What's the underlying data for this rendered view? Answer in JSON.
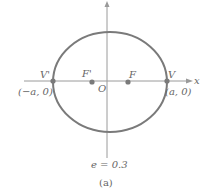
{
  "diagram": {
    "type": "ellipse",
    "caption": "(a)",
    "eccentricity_label": "e = 0.3",
    "axes": {
      "x_label": "x",
      "y_label": "y"
    },
    "points": {
      "vertex_left": {
        "label": "V'",
        "coord_label": "(−a, 0)"
      },
      "vertex_right": {
        "label": "V",
        "coord_label": "(a, 0)"
      },
      "focus_left": {
        "label": "F'"
      },
      "focus_right": {
        "label": "F"
      },
      "origin": {
        "label": "O"
      }
    },
    "colors": {
      "curve": "#7a7a7a",
      "axis": "#9a9a9a",
      "text": "#666666"
    }
  }
}
